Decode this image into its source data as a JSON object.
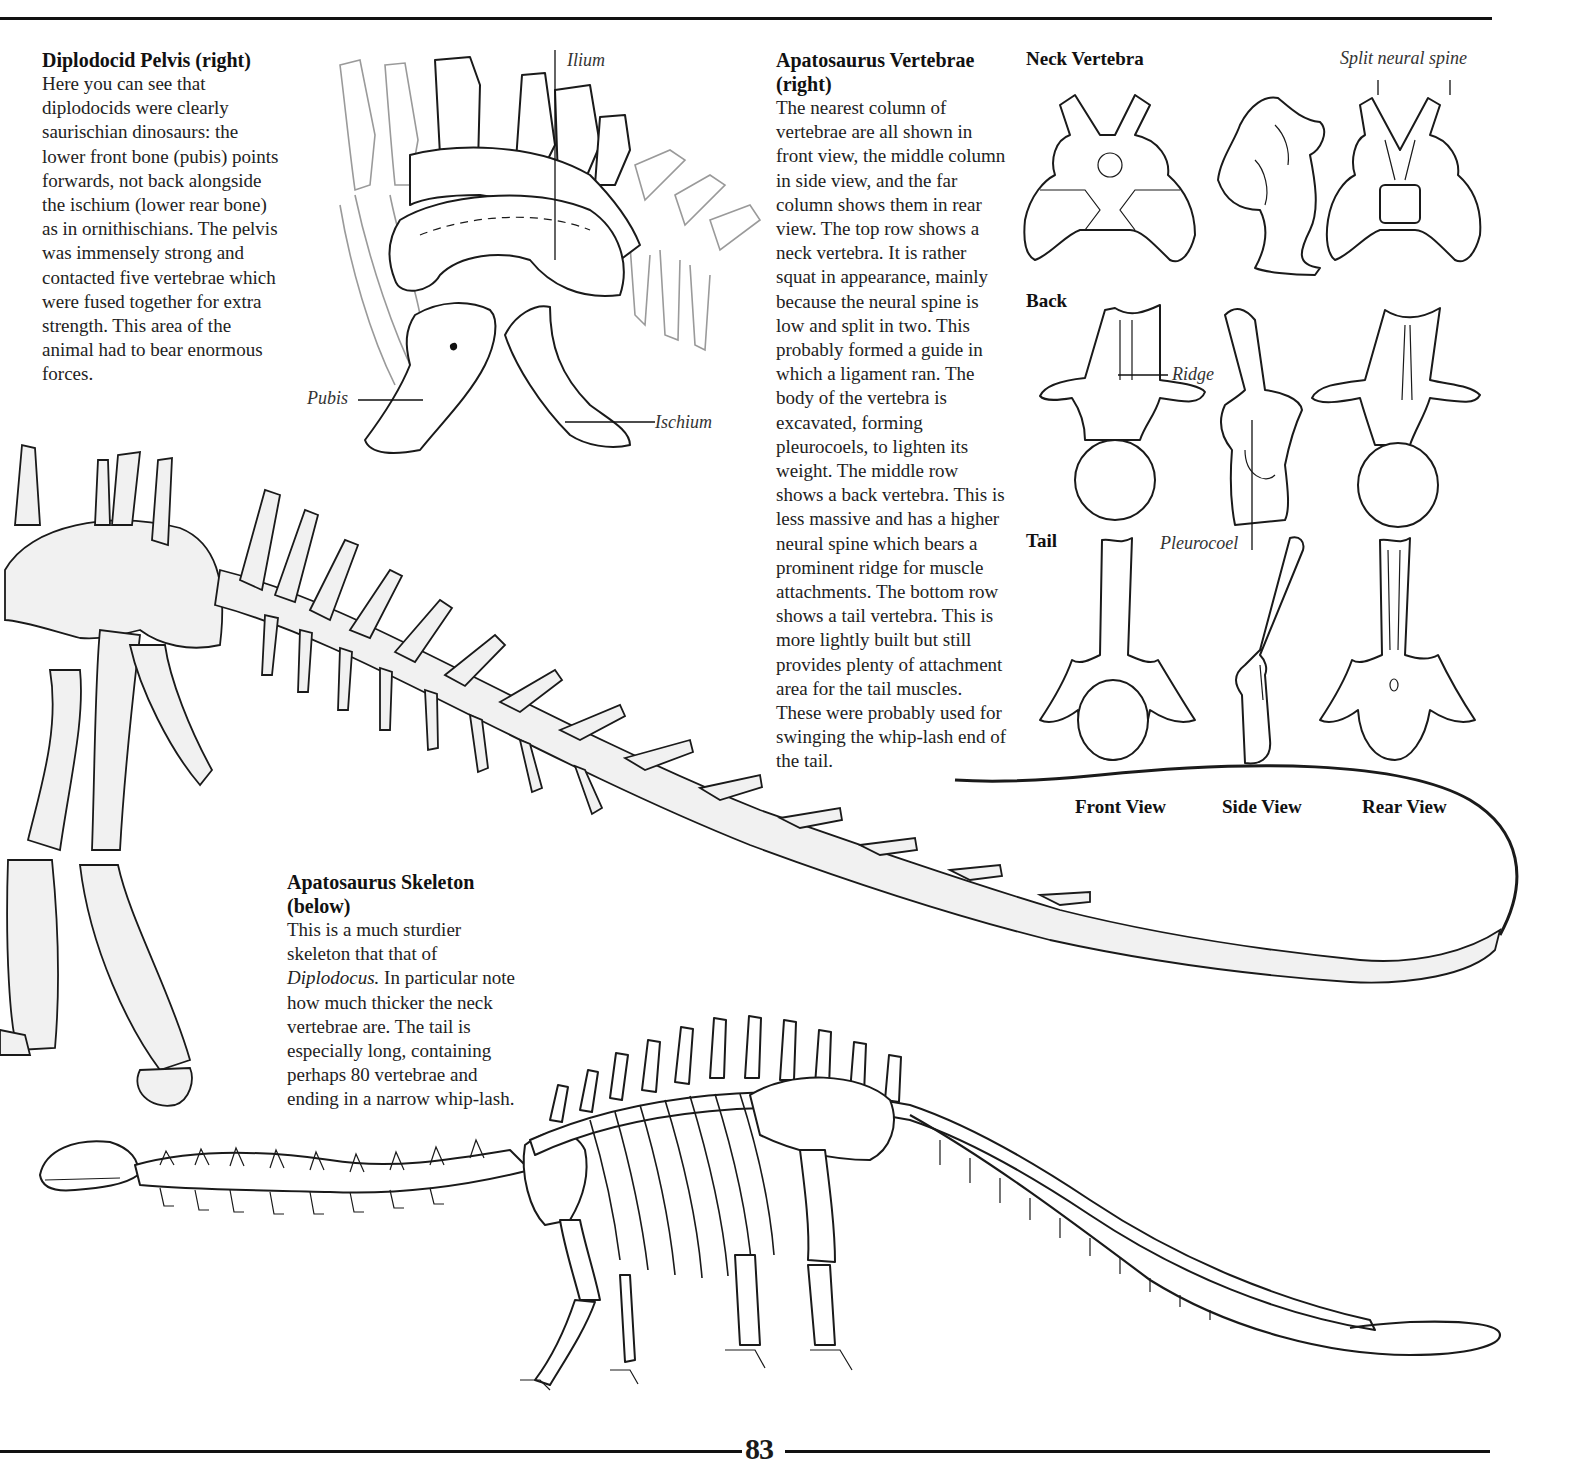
{
  "page": {
    "page_number": "83"
  },
  "pelvis_section": {
    "heading": "Diplodocid Pelvis (right)",
    "body": "Here you can see that diplodocids were clearly saurischian dinosaurs: the lower front bone (pubis) points forwards, not back alongside the ischium (lower rear bone) as in ornithischians. The pelvis was immensely strong and contacted five vertebrae which were fused together for extra strength. This area of the animal had to bear enormous forces.",
    "labels": {
      "ilium": "Ilium",
      "pubis": "Pubis",
      "ischium": "Ischium"
    }
  },
  "vertebrae_section": {
    "heading": "Apatosaurus Vertebrae (right)",
    "body": "The nearest column of vertebrae are all shown in front view, the middle column in side view, and the far column shows them in rear view. The top row shows a neck vertebra. It is rather squat in appearance, mainly because the neural spine is low and split in two. This probably formed a guide in which a ligament ran. The body of the vertebra is excavated, forming pleurocoels, to lighten its weight. The middle row shows a back vertebra. This is less massive and has a higher neural spine which bears a prominent ridge for muscle attachments. The bottom row shows a tail vertebra. This is more lightly built but still provides plenty of attachment area for the tail muscles. These were probably used for swinging the whip-lash end of the tail.",
    "rows": [
      {
        "label": "Neck Vertebra"
      },
      {
        "label": "Back"
      },
      {
        "label": "Tail"
      }
    ],
    "columns": [
      {
        "label": "Front View"
      },
      {
        "label": "Side View"
      },
      {
        "label": "Rear View"
      }
    ],
    "annotations": {
      "split_neural_spine": "Split neural spine",
      "ridge": "Ridge",
      "pleurocoel": "Pleurocoel"
    }
  },
  "skeleton_section": {
    "heading": "Apatosaurus Skeleton (below)",
    "body_before_italic": "This is a much sturdier skeleton that that of ",
    "body_italic": "Diplodocus.",
    "body_after_italic": " In particular note how much thicker the neck vertebrae are. The tail is especially long, containing perhaps 80 vertebrae and ending in a narrow whip-lash."
  }
}
